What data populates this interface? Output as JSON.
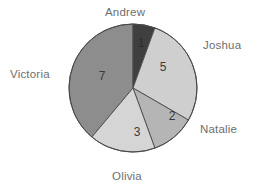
{
  "chart_data": {
    "type": "pie",
    "title": "",
    "categories": [
      "Andrew",
      "Joshua",
      "Natalie",
      "Olivia",
      "Victoria"
    ],
    "values": [
      1,
      5,
      2,
      3,
      7
    ],
    "total": 18,
    "value_labels": [
      "1",
      "5",
      "2",
      "3",
      "7"
    ],
    "legend": "labels-around-slices",
    "grid": false,
    "colors": [
      "#3f3f3f",
      "#cfcfcf",
      "#b5b5b5",
      "#d5d5d5",
      "#8d8d8d"
    ],
    "start_angle_deg": 0,
    "direction": "clockwise",
    "slice_angles_deg": [
      20,
      100,
      40,
      60,
      140
    ]
  },
  "labels": {
    "andrew": "Andrew",
    "joshua": "Joshua",
    "natalie": "Natalie",
    "olivia": "Olivia",
    "victoria": "Victoria"
  },
  "slice_values": {
    "andrew": "1",
    "joshua": "5",
    "natalie": "2",
    "olivia": "3",
    "victoria": "7"
  },
  "style": {
    "background": "#ffffff",
    "outline": "#4a4a4a",
    "label_color": "#6e6e6e"
  }
}
